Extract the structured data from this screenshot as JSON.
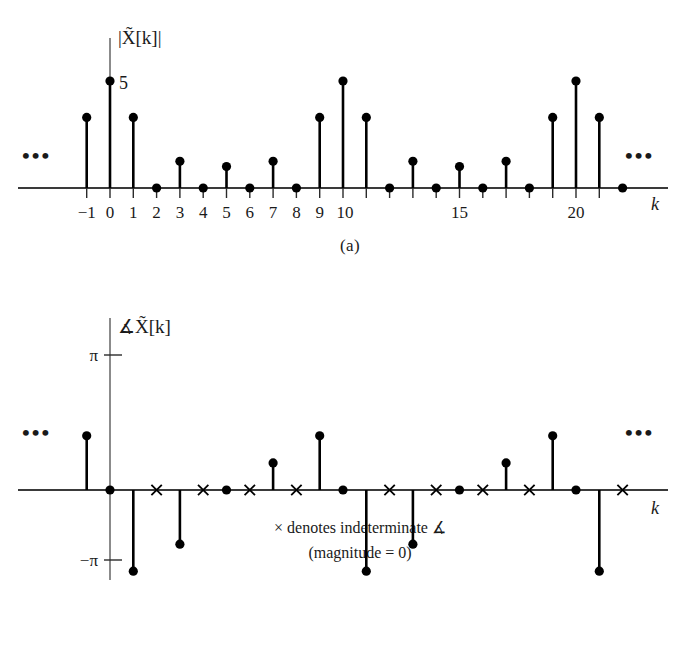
{
  "figure": {
    "caption_a": "(a)",
    "caption_b": "(b)",
    "ellipsis_left": "•••",
    "ellipsis_right": "•••"
  },
  "panel_a": {
    "ylabel": "|X̃[k]|",
    "xlabel": "k",
    "peak_label": "5",
    "tick_labels": [
      "−1",
      "0",
      "1",
      "2",
      "3",
      "4",
      "5",
      "6",
      "7",
      "8",
      "9",
      "10",
      "15",
      "20"
    ]
  },
  "panel_b": {
    "ylabel": "∡X̃[k]",
    "xlabel": "k",
    "pi_label": "π",
    "neg_pi_label": "−π",
    "note_line1": "× denotes indeterminate ∡",
    "note_line2": "(magnitude = 0)"
  },
  "chart_data": [
    {
      "type": "bar",
      "subtype": "stem",
      "title": "Magnitude of the discrete Fourier series coefficients",
      "xlabel": "k",
      "ylabel": "|X̃[k]|",
      "ylim": [
        0,
        5.6
      ],
      "xlim": [
        -2.2,
        22.8
      ],
      "grid": false,
      "legend": null,
      "annotations": [
        "5",
        "•••",
        "•••"
      ],
      "tick_positions": [
        -1,
        0,
        1,
        2,
        3,
        4,
        5,
        6,
        7,
        8,
        9,
        10,
        15,
        20
      ],
      "tick_labels": [
        "−1",
        "0",
        "1",
        "2",
        "3",
        "4",
        "5",
        "6",
        "7",
        "8",
        "9",
        "10",
        "15",
        "20"
      ],
      "x": [
        -1,
        0,
        1,
        2,
        3,
        4,
        5,
        6,
        7,
        8,
        9,
        10,
        11,
        12,
        13,
        14,
        15,
        16,
        17,
        18,
        19,
        20,
        21,
        22
      ],
      "values": [
        3.3,
        5.0,
        3.3,
        0.0,
        1.25,
        0.0,
        1.0,
        0.0,
        1.25,
        0.0,
        3.3,
        5.0,
        3.3,
        0.0,
        1.25,
        0.0,
        1.0,
        0.0,
        1.25,
        0.0,
        3.3,
        5.0,
        3.3,
        0.0
      ],
      "period": 10
    },
    {
      "type": "bar",
      "subtype": "stem",
      "title": "Phase of the discrete Fourier series coefficients",
      "xlabel": "k",
      "ylabel": "∡X̃[k]",
      "ylim": [
        -3.14159,
        3.14159
      ],
      "xlim": [
        -2.2,
        22.8
      ],
      "grid": false,
      "legend": null,
      "ytick_positions": [
        3.14159,
        -3.14159
      ],
      "ytick_labels": [
        "π",
        "−π"
      ],
      "annotations": [
        "× denotes indeterminate ∡",
        "(magnitude = 0)",
        "•••",
        "•••"
      ],
      "x": [
        -1,
        0,
        1,
        2,
        3,
        4,
        5,
        6,
        7,
        8,
        9,
        10,
        11,
        12,
        13,
        14,
        15,
        16,
        17,
        18,
        19,
        20,
        21,
        22
      ],
      "values": [
        1.26,
        0.0,
        -1.89,
        null,
        -1.26,
        null,
        0.0,
        null,
        0.63,
        null,
        1.26,
        0.0,
        -1.89,
        null,
        -1.26,
        null,
        0.0,
        null,
        0.63,
        null,
        1.26,
        0.0,
        -1.89,
        null
      ],
      "indeterminate_x": [
        2,
        4,
        6,
        8,
        12,
        14,
        16,
        18,
        22
      ],
      "indeterminate_marker": "×",
      "period": 10
    }
  ]
}
